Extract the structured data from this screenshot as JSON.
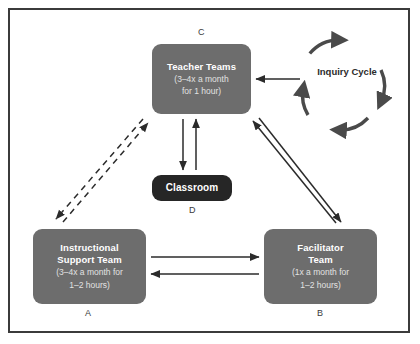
{
  "diagram": {
    "frame_border_color": "#3b3b3b",
    "background": "#ffffff",
    "node_fill_gray": "#6d6d6d",
    "node_fill_dark": "#262626",
    "arrow_color": "#2b2b2b"
  },
  "nodes": {
    "teacher_teams": {
      "tag": "C",
      "title": "Teacher Teams",
      "sub_line1": "(3–4x a month",
      "sub_line2": "for 1 hour)",
      "fill": "#6d6d6d"
    },
    "instructional_support_team": {
      "tag": "A",
      "title_line1": "Instructional",
      "title_line2": "Support Team",
      "sub_line1": "(3–4x a month for",
      "sub_line2": "1–2 hours)",
      "fill": "#6d6d6d"
    },
    "facilitator_team": {
      "tag": "B",
      "title_line1": "Facilitator",
      "title_line2": "Team",
      "sub_line1": "(1x a month for",
      "sub_line2": "1–2 hours)",
      "fill": "#6d6d6d"
    },
    "classroom": {
      "tag": "D",
      "title": "Classroom",
      "fill": "#262626"
    },
    "inquiry_cycle": {
      "label": "Inquiry Cycle",
      "shape": "four-arc-clockwise-circle",
      "stroke": "#4a4a4a"
    }
  },
  "connections": [
    {
      "name": "inquiry-cycle-to-teacher-teams",
      "from": "inquiry_cycle",
      "to": "teacher_teams",
      "style": "solid",
      "direction": "single"
    },
    {
      "name": "teacher-teams-to-classroom",
      "from": "teacher_teams",
      "to": "classroom",
      "style": "solid",
      "direction": "single"
    },
    {
      "name": "classroom-to-teacher-teams",
      "from": "classroom",
      "to": "teacher_teams",
      "style": "solid",
      "direction": "single"
    },
    {
      "name": "support-to-teacher-teams-dashed",
      "from": "instructional_support_team",
      "to": "teacher_teams",
      "style": "dashed",
      "direction": "single"
    },
    {
      "name": "teacher-teams-to-support-dashed",
      "from": "teacher_teams",
      "to": "instructional_support_team",
      "style": "dashed",
      "direction": "single"
    },
    {
      "name": "facilitator-to-teacher-teams",
      "from": "facilitator_team",
      "to": "teacher_teams",
      "style": "solid",
      "direction": "single"
    },
    {
      "name": "teacher-teams-to-facilitator",
      "from": "teacher_teams",
      "to": "facilitator_team",
      "style": "solid",
      "direction": "single"
    },
    {
      "name": "support-to-facilitator",
      "from": "instructional_support_team",
      "to": "facilitator_team",
      "style": "solid",
      "direction": "single"
    },
    {
      "name": "facilitator-to-support",
      "from": "facilitator_team",
      "to": "instructional_support_team",
      "style": "solid",
      "direction": "single"
    }
  ]
}
